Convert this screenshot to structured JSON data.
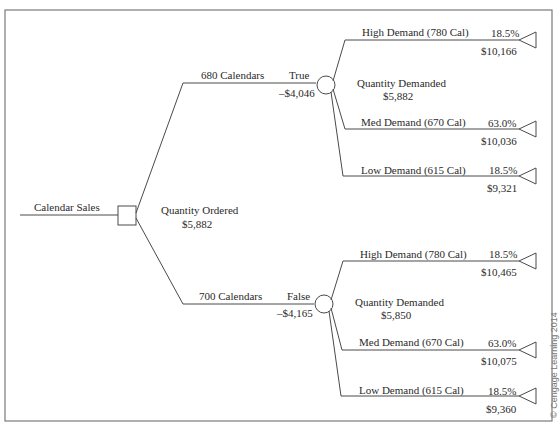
{
  "diagram": {
    "type": "decision-tree",
    "root": {
      "label": "Calendar Sales",
      "node_type": "decision",
      "summary_label": "Quantity Ordered",
      "summary_value": "$5,882"
    },
    "branches": [
      {
        "label": "680 Calendars",
        "flag": "True",
        "value": "–$4,046",
        "chance_label": "Quantity Demanded",
        "chance_value": "$5,882",
        "outcomes": [
          {
            "label": "High Demand (780 Cal)",
            "prob": "18.5%",
            "payoff": "$10,166"
          },
          {
            "label": "Med Demand (670 Cal)",
            "prob": "63.0%",
            "payoff": "$10,036"
          },
          {
            "label": "Low Demand (615 Cal)",
            "prob": "18.5%",
            "payoff": "$9,321"
          }
        ]
      },
      {
        "label": "700 Calendars",
        "flag": "False",
        "value": "–$4,165",
        "chance_label": "Quantity Demanded",
        "chance_value": "$5,850",
        "outcomes": [
          {
            "label": "High Demand (780 Cal)",
            "prob": "18.5%",
            "payoff": "$10,465"
          },
          {
            "label": "Med Demand (670 Cal)",
            "prob": "63.0%",
            "payoff": "$10,075"
          },
          {
            "label": "Low Demand (615 Cal)",
            "prob": "18.5%",
            "payoff": "$9,360"
          }
        ]
      }
    ],
    "icons": {
      "decision_node": "square-node-icon",
      "chance_node": "circle-node-icon",
      "terminal_node": "triangle-node-icon"
    }
  },
  "copyright": "© Cengage Learning 2014"
}
